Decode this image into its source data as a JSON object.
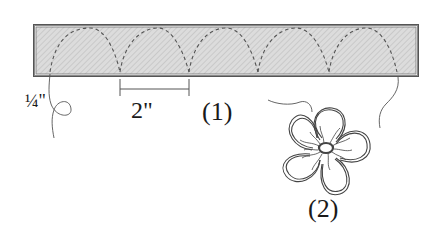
{
  "diagram": {
    "type": "quilting stitch illustration",
    "strip": {
      "description": "hatched fabric strip with dashed looping stitch line",
      "fill_color": "#d9d9d9",
      "border_color": "#6b6b6b",
      "stitch_color": "#555555"
    },
    "labels": {
      "quarter_inch": "¼\"",
      "two_inch": "2\"",
      "figure_1": "(1)",
      "figure_2": "(2)"
    },
    "figures": [
      {
        "id": "1",
        "label": "(1)",
        "content": "continuous loop stitching along a strip, loops spaced 2\" apart, 1/4\" from edge"
      },
      {
        "id": "2",
        "label": "(2)",
        "content": "five-petal flower with echo outline and stamen stitching"
      }
    ],
    "dimensions": {
      "loop_spacing": "2\"",
      "edge_offset": "¼\""
    }
  }
}
